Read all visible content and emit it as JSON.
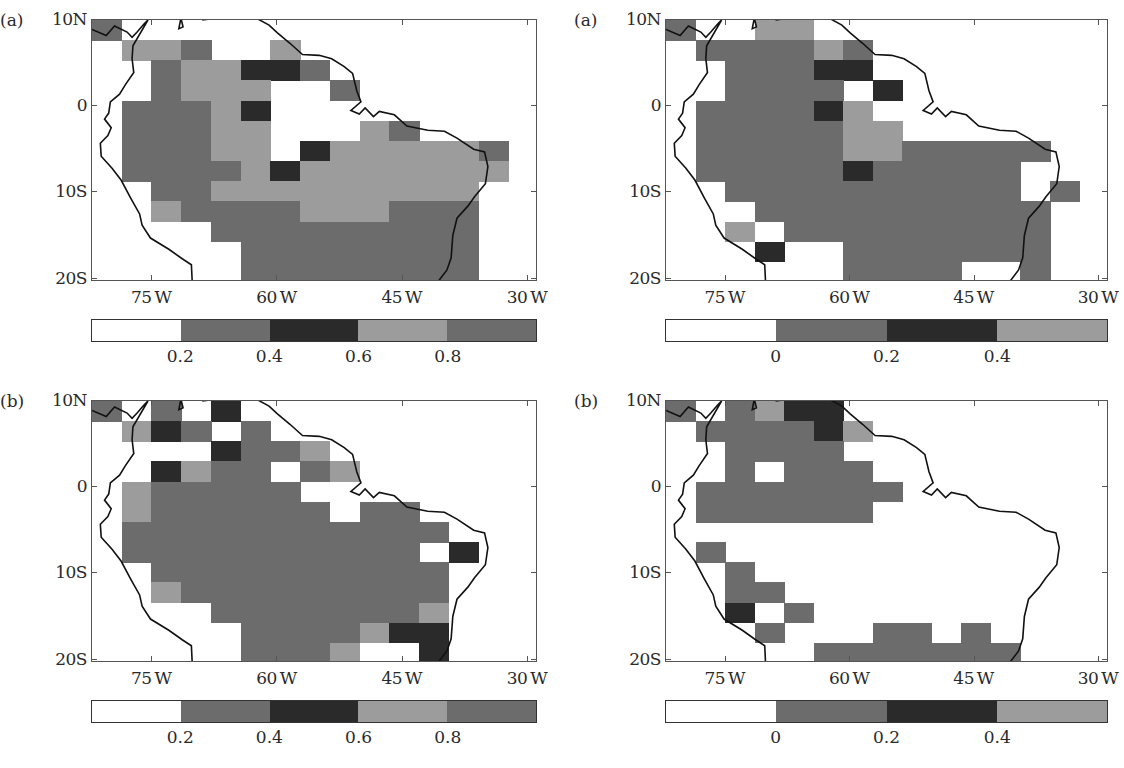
{
  "palette": {
    "0": "#ffffff",
    "1": "#6c6c6c",
    "2": "#2a2a2a",
    "3": "#9c9c9c"
  },
  "axes": {
    "y_ticks": [
      "10N",
      "0",
      "10S",
      "20S"
    ],
    "x_ticks": [
      "75W",
      "60W",
      "45W",
      "30W"
    ]
  },
  "panels": [
    {
      "id": "left-a",
      "label": "(a)",
      "colorbar": {
        "segments": [
          "#ffffff",
          "#6c6c6c",
          "#2a2a2a",
          "#9c9c9c",
          "#6c6c6c"
        ],
        "ticks": [
          "0.2",
          "0.4",
          "0.6",
          "0.8"
        ]
      },
      "grid": [
        [
          1,
          0,
          0,
          0,
          0,
          0,
          0,
          0,
          0,
          0,
          0,
          0,
          0,
          0,
          0
        ],
        [
          0,
          3,
          3,
          1,
          0,
          0,
          3,
          0,
          0,
          0,
          0,
          0,
          0,
          0,
          0
        ],
        [
          0,
          0,
          1,
          3,
          3,
          2,
          2,
          1,
          0,
          0,
          0,
          0,
          0,
          0,
          0
        ],
        [
          0,
          0,
          1,
          3,
          3,
          3,
          0,
          0,
          1,
          0,
          0,
          0,
          0,
          0,
          0
        ],
        [
          0,
          1,
          1,
          1,
          3,
          2,
          0,
          0,
          0,
          0,
          0,
          0,
          0,
          0,
          0
        ],
        [
          0,
          1,
          1,
          1,
          3,
          3,
          0,
          0,
          0,
          3,
          1,
          0,
          0,
          0,
          0
        ],
        [
          0,
          1,
          1,
          1,
          3,
          3,
          0,
          2,
          3,
          3,
          3,
          3,
          3,
          1,
          0
        ],
        [
          0,
          1,
          1,
          1,
          1,
          3,
          2,
          3,
          3,
          3,
          3,
          3,
          3,
          3,
          0
        ],
        [
          0,
          0,
          1,
          1,
          3,
          3,
          3,
          3,
          3,
          3,
          3,
          3,
          3,
          0,
          0
        ],
        [
          0,
          0,
          3,
          1,
          1,
          1,
          1,
          3,
          3,
          3,
          1,
          1,
          1,
          0,
          0
        ],
        [
          0,
          0,
          0,
          0,
          1,
          1,
          1,
          1,
          1,
          1,
          1,
          1,
          1,
          0,
          0
        ],
        [
          0,
          0,
          0,
          0,
          0,
          1,
          1,
          1,
          1,
          1,
          1,
          1,
          1,
          0,
          0
        ],
        [
          0,
          0,
          0,
          0,
          0,
          1,
          1,
          1,
          1,
          1,
          1,
          1,
          1,
          0,
          0
        ]
      ]
    },
    {
      "id": "right-a",
      "label": "(a)",
      "colorbar": {
        "segments": [
          "#ffffff",
          "#6c6c6c",
          "#2a2a2a",
          "#9c9c9c"
        ],
        "ticks": [
          "0",
          "0.2",
          "0.4"
        ]
      },
      "grid": [
        [
          1,
          0,
          0,
          3,
          3,
          0,
          0,
          0,
          0,
          0,
          0,
          0,
          0,
          0,
          0
        ],
        [
          0,
          1,
          1,
          1,
          1,
          3,
          1,
          0,
          0,
          0,
          0,
          0,
          0,
          0,
          0
        ],
        [
          0,
          0,
          1,
          1,
          1,
          2,
          2,
          0,
          0,
          0,
          0,
          0,
          0,
          0,
          0
        ],
        [
          0,
          0,
          1,
          1,
          1,
          1,
          0,
          2,
          0,
          0,
          0,
          0,
          0,
          0,
          0
        ],
        [
          0,
          1,
          1,
          1,
          1,
          2,
          3,
          0,
          0,
          0,
          0,
          0,
          0,
          0,
          0
        ],
        [
          0,
          1,
          1,
          1,
          1,
          1,
          3,
          3,
          0,
          0,
          0,
          0,
          0,
          0,
          0
        ],
        [
          0,
          1,
          1,
          1,
          1,
          1,
          3,
          3,
          1,
          1,
          1,
          1,
          1,
          0,
          0
        ],
        [
          0,
          1,
          1,
          1,
          1,
          1,
          2,
          1,
          1,
          1,
          1,
          1,
          0,
          0,
          0
        ],
        [
          0,
          0,
          1,
          1,
          1,
          1,
          1,
          1,
          1,
          1,
          1,
          1,
          0,
          1,
          0
        ],
        [
          0,
          0,
          0,
          1,
          1,
          1,
          1,
          1,
          1,
          1,
          1,
          1,
          1,
          0,
          0
        ],
        [
          0,
          0,
          3,
          0,
          1,
          1,
          1,
          1,
          1,
          1,
          1,
          1,
          1,
          0,
          0
        ],
        [
          0,
          0,
          0,
          2,
          0,
          0,
          1,
          1,
          1,
          1,
          1,
          1,
          1,
          0,
          0
        ],
        [
          0,
          0,
          0,
          0,
          0,
          0,
          1,
          1,
          1,
          1,
          0,
          0,
          1,
          0,
          0
        ]
      ]
    },
    {
      "id": "left-b",
      "label": "(b)",
      "colorbar": {
        "segments": [
          "#ffffff",
          "#6c6c6c",
          "#2a2a2a",
          "#9c9c9c",
          "#6c6c6c"
        ],
        "ticks": [
          "0.2",
          "0.4",
          "0.6",
          "0.8"
        ]
      },
      "grid": [
        [
          1,
          0,
          1,
          0,
          2,
          0,
          0,
          0,
          0,
          0,
          0,
          0,
          0,
          0,
          0
        ],
        [
          0,
          3,
          2,
          1,
          0,
          1,
          0,
          0,
          0,
          0,
          0,
          0,
          0,
          0,
          0
        ],
        [
          0,
          0,
          0,
          0,
          2,
          1,
          1,
          3,
          0,
          0,
          0,
          0,
          0,
          0,
          0
        ],
        [
          0,
          0,
          2,
          3,
          1,
          1,
          0,
          1,
          3,
          0,
          0,
          0,
          0,
          0,
          0
        ],
        [
          0,
          3,
          1,
          1,
          1,
          1,
          1,
          0,
          0,
          0,
          0,
          0,
          0,
          0,
          0
        ],
        [
          0,
          3,
          1,
          1,
          1,
          1,
          1,
          1,
          0,
          1,
          1,
          0,
          0,
          0,
          0
        ],
        [
          0,
          1,
          1,
          1,
          1,
          1,
          1,
          1,
          1,
          1,
          1,
          1,
          0,
          0,
          0
        ],
        [
          0,
          1,
          1,
          1,
          1,
          1,
          1,
          1,
          1,
          1,
          1,
          0,
          2,
          0,
          0
        ],
        [
          0,
          0,
          1,
          1,
          1,
          1,
          1,
          1,
          1,
          1,
          1,
          1,
          0,
          0,
          0
        ],
        [
          0,
          0,
          3,
          1,
          1,
          1,
          1,
          1,
          1,
          1,
          1,
          1,
          0,
          0,
          0
        ],
        [
          0,
          0,
          0,
          0,
          1,
          1,
          1,
          1,
          1,
          1,
          1,
          3,
          0,
          0,
          0
        ],
        [
          0,
          0,
          0,
          0,
          0,
          1,
          1,
          1,
          1,
          3,
          2,
          2,
          0,
          0,
          0
        ],
        [
          0,
          0,
          0,
          0,
          0,
          1,
          1,
          1,
          3,
          0,
          0,
          2,
          0,
          0,
          0
        ]
      ]
    },
    {
      "id": "right-b",
      "label": "(b)",
      "colorbar": {
        "segments": [
          "#ffffff",
          "#6c6c6c",
          "#2a2a2a",
          "#9c9c9c"
        ],
        "ticks": [
          "0",
          "0.2",
          "0.4"
        ]
      },
      "grid": [
        [
          1,
          0,
          1,
          3,
          2,
          2,
          0,
          0,
          0,
          0,
          0,
          0,
          0,
          0,
          0
        ],
        [
          0,
          1,
          1,
          1,
          1,
          2,
          3,
          0,
          0,
          0,
          0,
          0,
          0,
          0,
          0
        ],
        [
          0,
          0,
          1,
          1,
          1,
          1,
          0,
          0,
          0,
          0,
          0,
          0,
          0,
          0,
          0
        ],
        [
          0,
          0,
          1,
          0,
          1,
          1,
          1,
          0,
          0,
          0,
          0,
          0,
          0,
          0,
          0
        ],
        [
          0,
          1,
          1,
          1,
          1,
          1,
          1,
          1,
          0,
          0,
          0,
          0,
          0,
          0,
          0
        ],
        [
          0,
          1,
          1,
          1,
          1,
          1,
          1,
          0,
          0,
          0,
          0,
          0,
          0,
          0,
          0
        ],
        [
          0,
          0,
          0,
          0,
          0,
          0,
          0,
          0,
          0,
          0,
          0,
          0,
          0,
          0,
          0
        ],
        [
          0,
          1,
          0,
          0,
          0,
          0,
          0,
          0,
          0,
          0,
          0,
          0,
          0,
          0,
          0
        ],
        [
          0,
          0,
          1,
          0,
          0,
          0,
          0,
          0,
          0,
          0,
          0,
          0,
          0,
          0,
          0
        ],
        [
          0,
          0,
          1,
          1,
          0,
          0,
          0,
          0,
          0,
          0,
          0,
          0,
          0,
          0,
          0
        ],
        [
          0,
          0,
          2,
          0,
          1,
          0,
          0,
          0,
          0,
          0,
          0,
          0,
          0,
          0,
          0
        ],
        [
          0,
          0,
          0,
          1,
          0,
          0,
          0,
          1,
          1,
          0,
          1,
          0,
          0,
          0,
          0
        ],
        [
          0,
          0,
          0,
          0,
          0,
          1,
          1,
          1,
          1,
          1,
          1,
          1,
          0,
          0,
          0
        ]
      ]
    }
  ],
  "chart_data": [
    {
      "type": "heatmap",
      "title": "(a) left",
      "xlabel": "",
      "ylabel": "",
      "x_ticks": [
        "75W",
        "60W",
        "45W",
        "30W"
      ],
      "y_ticks": [
        "10N",
        "0",
        "10S",
        "20S"
      ],
      "colorbar_ticks": [
        0.2,
        0.4,
        0.6,
        0.8
      ],
      "colorbar_classes": [
        "<0.2",
        "0.2-0.4",
        "0.4-0.6",
        "0.6-0.8",
        ">0.8"
      ],
      "grid_shape": [
        13,
        15
      ],
      "xlim": [
        "~82W",
        "~29W"
      ],
      "ylim": [
        "~20.5S",
        "~10N"
      ]
    },
    {
      "type": "heatmap",
      "title": "(a) right",
      "x_ticks": [
        "75W",
        "60W",
        "45W",
        "30W"
      ],
      "y_ticks": [
        "10N",
        "0",
        "10S",
        "20S"
      ],
      "colorbar_ticks": [
        0,
        0.2,
        0.4
      ],
      "colorbar_classes": [
        "<0",
        "0-0.2",
        "0.2-0.4",
        ">0.4"
      ],
      "grid_shape": [
        13,
        15
      ]
    },
    {
      "type": "heatmap",
      "title": "(b) left",
      "x_ticks": [
        "75W",
        "60W",
        "45W",
        "30W"
      ],
      "y_ticks": [
        "10N",
        "0",
        "10S",
        "20S"
      ],
      "colorbar_ticks": [
        0.2,
        0.4,
        0.6,
        0.8
      ],
      "colorbar_classes": [
        "<0.2",
        "0.2-0.4",
        "0.4-0.6",
        "0.6-0.8",
        ">0.8"
      ],
      "grid_shape": [
        13,
        15
      ]
    },
    {
      "type": "heatmap",
      "title": "(b) right",
      "x_ticks": [
        "75W",
        "60W",
        "45W",
        "30W"
      ],
      "y_ticks": [
        "10N",
        "0",
        "10S",
        "20S"
      ],
      "colorbar_ticks": [
        0,
        0.2,
        0.4
      ],
      "colorbar_classes": [
        "<0",
        "0-0.2",
        "0.2-0.4",
        ">0.4"
      ],
      "grid_shape": [
        13,
        15
      ]
    }
  ]
}
